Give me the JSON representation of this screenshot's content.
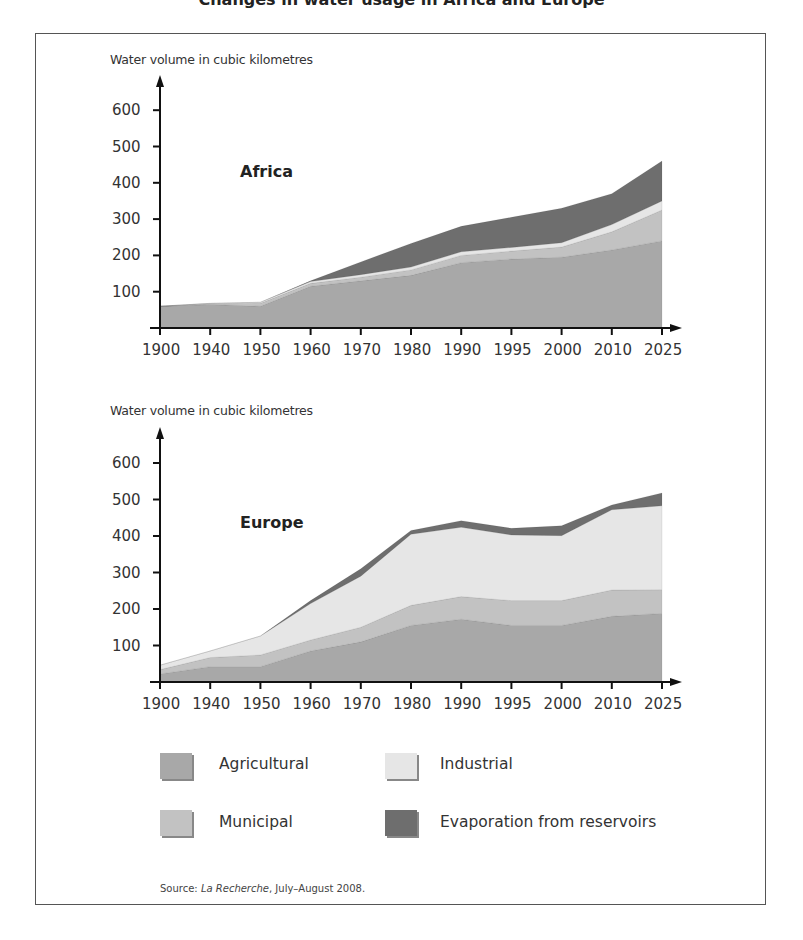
{
  "page": {
    "title_partial": "Changes in water usage in Africa and Europe",
    "source_prefix": "Source: ",
    "source_publication": "La Recherche",
    "source_suffix": ", July–August 2008."
  },
  "colors": {
    "agricultural": "#a8a8a8",
    "municipal": "#c2c2c2",
    "industrial": "#e6e6e6",
    "evaporation": "#6e6e6e",
    "axis": "#111111",
    "frame": "#555555"
  },
  "legend": [
    {
      "key": "agricultural",
      "label": "Agricultural"
    },
    {
      "key": "industrial",
      "label": "Industrial"
    },
    {
      "key": "municipal",
      "label": "Municipal"
    },
    {
      "key": "evaporation",
      "label": "Evaporation from reservoirs"
    }
  ],
  "chart_data": [
    {
      "type": "area",
      "stacked": true,
      "title": "Africa",
      "ylabel": "Water volume in cubic kilometres",
      "xlabel": "",
      "categories": [
        "1900",
        "1940",
        "1950",
        "1960",
        "1970",
        "1980",
        "1990",
        "1995",
        "2000",
        "2010",
        "2025"
      ],
      "yticks": [
        100,
        200,
        300,
        400,
        500,
        600
      ],
      "ylim": [
        0,
        650
      ],
      "grid": false,
      "legend_position": "bottom",
      "series": [
        {
          "name": "Agricultural",
          "values": [
            60,
            65,
            60,
            115,
            130,
            145,
            180,
            190,
            195,
            215,
            240
          ]
        },
        {
          "name": "Municipal",
          "values": [
            0,
            2,
            8,
            8,
            10,
            15,
            20,
            22,
            28,
            50,
            85
          ]
        },
        {
          "name": "Industrial",
          "values": [
            0,
            1,
            3,
            5,
            7,
            8,
            10,
            10,
            12,
            20,
            25
          ]
        },
        {
          "name": "Evaporation from reservoirs",
          "values": [
            0,
            0,
            0,
            2,
            35,
            65,
            70,
            83,
            95,
            85,
            110
          ]
        }
      ]
    },
    {
      "type": "area",
      "stacked": true,
      "title": "Europe",
      "ylabel": "Water volume in cubic kilometres",
      "xlabel": "",
      "categories": [
        "1900",
        "1940",
        "1950",
        "1960",
        "1970",
        "1980",
        "1990",
        "1995",
        "2000",
        "2010",
        "2025"
      ],
      "yticks": [
        100,
        200,
        300,
        400,
        500,
        600
      ],
      "ylim": [
        0,
        650
      ],
      "grid": false,
      "legend_position": "bottom",
      "series": [
        {
          "name": "Agricultural",
          "values": [
            22,
            42,
            42,
            85,
            110,
            155,
            172,
            155,
            155,
            180,
            188
          ]
        },
        {
          "name": "Municipal",
          "values": [
            12,
            25,
            32,
            30,
            40,
            55,
            62,
            68,
            68,
            72,
            65
          ]
        },
        {
          "name": "Industrial",
          "values": [
            12,
            18,
            52,
            100,
            140,
            195,
            190,
            180,
            178,
            220,
            230
          ]
        },
        {
          "name": "Evaporation from reservoirs",
          "values": [
            0,
            0,
            0,
            8,
            20,
            10,
            18,
            18,
            27,
            13,
            35
          ]
        }
      ]
    }
  ]
}
